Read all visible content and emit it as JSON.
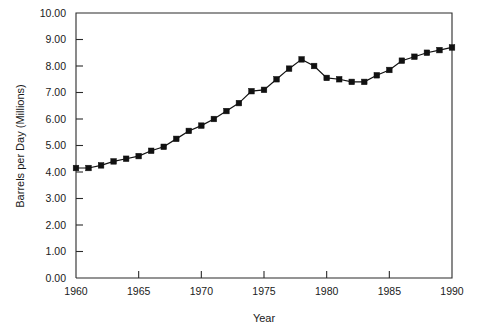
{
  "chart_data": {
    "type": "line",
    "title": "",
    "subtitle": "",
    "xlabel": "Year",
    "ylabel": "Barrels per Day (Millions)",
    "xlim": [
      1960,
      1990
    ],
    "ylim": [
      0.0,
      10.0
    ],
    "grid": false,
    "legend": null,
    "marker": "square",
    "line_color": "#111111",
    "marker_color": "#111111",
    "xticks": [
      1960,
      1965,
      1970,
      1975,
      1980,
      1985,
      1990
    ],
    "xtick_labels": [
      "1960",
      "1965",
      "1970",
      "1975",
      "1980",
      "1985",
      "1990"
    ],
    "yticks": [
      0.0,
      1.0,
      2.0,
      3.0,
      4.0,
      5.0,
      6.0,
      7.0,
      8.0,
      9.0,
      10.0
    ],
    "ytick_labels": [
      "0.00",
      "1.00",
      "2.00",
      "3.00",
      "4.00",
      "5.00",
      "6.00",
      "7.00",
      "8.00",
      "9.00",
      "10.00"
    ],
    "x": [
      1960,
      1961,
      1962,
      1963,
      1964,
      1965,
      1966,
      1967,
      1968,
      1969,
      1970,
      1971,
      1972,
      1973,
      1974,
      1975,
      1976,
      1977,
      1978,
      1979,
      1980,
      1981,
      1982,
      1983,
      1984,
      1985,
      1986,
      1987,
      1988,
      1989,
      1990
    ],
    "values": [
      4.15,
      4.15,
      4.25,
      4.4,
      4.5,
      4.6,
      4.8,
      4.95,
      5.25,
      5.55,
      5.75,
      6.0,
      6.3,
      6.6,
      7.05,
      7.1,
      7.5,
      7.9,
      8.25,
      8.0,
      7.55,
      7.5,
      7.4,
      7.4,
      7.65,
      7.85,
      8.2,
      8.35,
      8.5,
      8.6,
      8.7
    ],
    "series": [
      {
        "name": "Barrels per Day",
        "values": [
          4.15,
          4.15,
          4.25,
          4.4,
          4.5,
          4.6,
          4.8,
          4.95,
          5.25,
          5.55,
          5.75,
          6.0,
          6.3,
          6.6,
          7.05,
          7.1,
          7.5,
          7.9,
          8.25,
          8.0,
          7.55,
          7.5,
          7.4,
          7.4,
          7.65,
          7.85,
          8.2,
          8.35,
          8.5,
          8.6,
          8.7
        ]
      }
    ]
  }
}
